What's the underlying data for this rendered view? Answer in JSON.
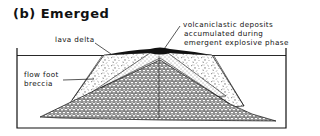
{
  "figure": {
    "title": "(b) Emerged",
    "labels": {
      "lava_delta": "lava delta",
      "volcaniclastic_line1": "volcaniclastic deposits",
      "volcaniclastic_line2": "accumulated during",
      "volcaniclastic_line3": "emergent explosive phase",
      "flow_foot_line1": "flow foot",
      "flow_foot_line2": "breccia"
    }
  }
}
